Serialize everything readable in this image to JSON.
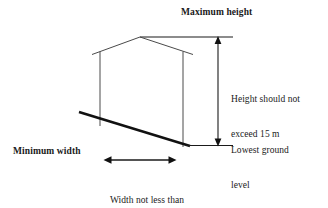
{
  "diagram": {
    "title": "Maximum height",
    "labels": {
      "maximum_height": "Maximum height",
      "minimum_width": "Minimum width",
      "height_note_line1": "Height should not",
      "height_note_line2": "exceed 15 m",
      "ground_note_line1": "Lowest ground",
      "ground_note_line2": "level",
      "width_note_line1": "Width not less than",
      "width_note_line2": "half the height"
    },
    "values": {
      "max_height": "15 m",
      "width_rule": "half the height"
    },
    "colors": {
      "background": "#ffffff",
      "line": "#1a1a1a",
      "building_line": "#3a3a3a",
      "text": "#1a1a1a"
    },
    "geometry": {
      "roof_apex": [
        140,
        37
      ],
      "roof_left_eave": [
        92,
        54
      ],
      "roof_right_eave": [
        193,
        54
      ],
      "wall_left_x": 100,
      "wall_right_x": 183,
      "wall_top_y": 52,
      "wall_left_bottom_y": 126,
      "wall_right_bottom_y": 147,
      "ground_slope_start": [
        79,
        112
      ],
      "ground_slope_end": [
        190,
        146
      ],
      "height_dim_x": 218,
      "height_dim_top_y": 37,
      "height_dim_bottom_y": 145,
      "width_dim_y": 160,
      "width_dim_left_x": 105,
      "width_dim_right_x": 175
    }
  }
}
